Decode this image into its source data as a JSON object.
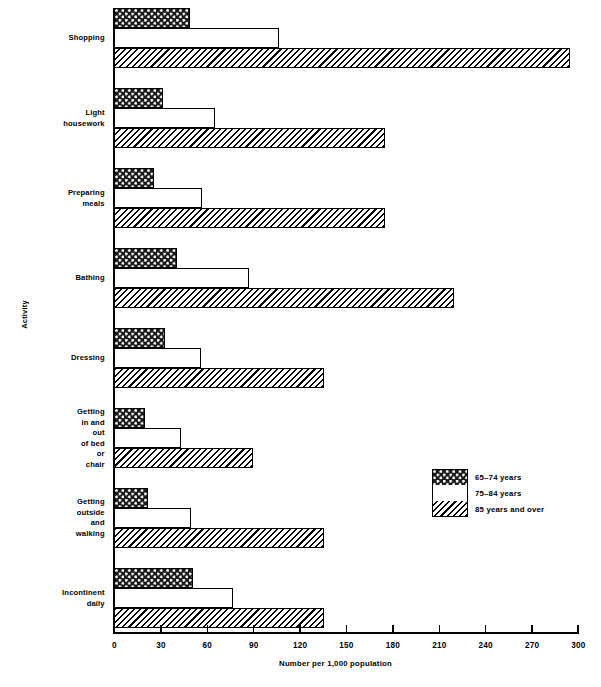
{
  "chart_data": {
    "type": "bar",
    "orientation": "horizontal",
    "title": "",
    "xlabel": "Number per 1,000 population",
    "ylabel": "Activity",
    "xlim": [
      0,
      300
    ],
    "xticks": [
      0,
      30,
      60,
      90,
      120,
      150,
      180,
      210,
      240,
      270,
      300
    ],
    "grid": false,
    "legend_position": "middle-right",
    "categories": [
      "Shopping",
      "Light housework",
      "Preparing meals",
      "Bathing",
      "Dressing",
      "Getting in and out\nof bed or chair",
      "Getting outside\nand walking",
      "Incontinent daily"
    ],
    "series": [
      {
        "name": "65–74 years",
        "pattern": "dark-checker-dots",
        "values": [
          49,
          32,
          26,
          41,
          33,
          20,
          22,
          51
        ]
      },
      {
        "name": "75–84 years",
        "pattern": "light-stipple",
        "values": [
          107,
          65,
          57,
          87,
          56,
          43,
          50,
          77
        ]
      },
      {
        "name": "85 years and over",
        "pattern": "diagonal-hatch",
        "values": [
          295,
          175,
          175,
          220,
          136,
          90,
          136,
          136
        ]
      }
    ]
  }
}
